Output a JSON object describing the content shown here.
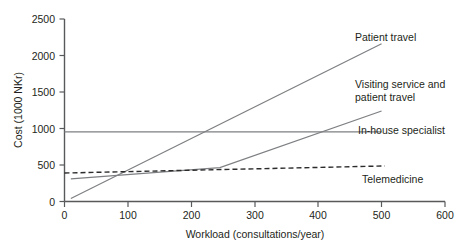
{
  "chart_data": {
    "type": "line",
    "title": "",
    "xlabel": "Workload (consultations/year)",
    "ylabel": "Cost (1000 NKr)",
    "xlim": [
      0,
      600
    ],
    "ylim": [
      0,
      2500
    ],
    "xticks": [
      "0",
      "100",
      "200",
      "300",
      "400",
      "500",
      "600"
    ],
    "yticks": [
      "0",
      "500",
      "1000",
      "1500",
      "2000",
      "2500"
    ],
    "grid": false,
    "legend_position": "inline-right-labels",
    "series": [
      {
        "name": "Patient travel",
        "label": "Patient travel",
        "style": "solid",
        "color": "#7d7f82",
        "x": [
          10,
          500
        ],
        "values": [
          40,
          2160
        ]
      },
      {
        "name": "Visiting service and patient travel",
        "label": "Visiting service and patient travel",
        "label_line1": "Visiting service and",
        "label_line2": "patient travel",
        "style": "solid",
        "color": "#7d7f82",
        "x": [
          10,
          245,
          500
        ],
        "values": [
          310,
          465,
          1240
        ]
      },
      {
        "name": "In-house specialist",
        "label": "In-house specialist",
        "style": "solid",
        "color": "#7d7f82",
        "x": [
          0,
          500
        ],
        "values": [
          955,
          955
        ]
      },
      {
        "name": "Telemedicine",
        "label": "Telemedicine",
        "style": "dashed",
        "color": "#2b2b2b",
        "x": [
          0,
          505
        ],
        "values": [
          390,
          487
        ]
      }
    ]
  },
  "labels": {
    "patient_travel": "Patient travel",
    "visiting_line1": "Visiting service and",
    "visiting_line2": "patient travel",
    "in_house": "In-house specialist",
    "telemedicine": "Telemedicine",
    "x_axis_title": "Workload (consultations/year)",
    "y_axis_title": "Cost (1000 NKr)"
  },
  "ticks": {
    "y": [
      "2500",
      "2000",
      "1500",
      "1000",
      "500",
      "0"
    ],
    "x": [
      "0",
      "100",
      "200",
      "300",
      "400",
      "500",
      "600"
    ]
  }
}
